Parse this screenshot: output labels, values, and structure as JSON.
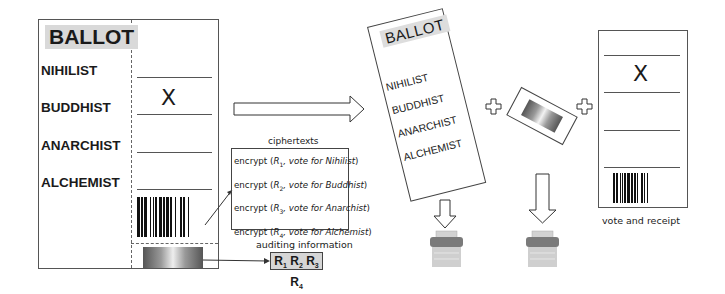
{
  "diagram": {
    "left_ballot": {
      "title": "BALLOT",
      "candidates": [
        "NIHILIST",
        "BUDDHIST",
        "ANARCHIST",
        "ALCHEMIST"
      ],
      "marked_candidate_index": 1,
      "mark": "X"
    },
    "ciphertexts": {
      "title": "ciphertexts",
      "rows": [
        {
          "prefix": "encrypt (",
          "r": "R",
          "r_sub": "1",
          "mid": ", vote for ",
          "candidate": "Nihilist",
          "suffix": ")"
        },
        {
          "prefix": "encrypt (",
          "r": "R",
          "r_sub": "2",
          "mid": ", vote for ",
          "candidate": "Buddhist",
          "suffix": ")"
        },
        {
          "prefix": "encrypt (",
          "r": "R",
          "r_sub": "3",
          "mid": ", vote for ",
          "candidate": "Anarchist",
          "suffix": ")"
        },
        {
          "prefix": "encrypt (",
          "r": "R",
          "r_sub": "4",
          "mid": ", vote for ",
          "candidate": "Alchemist",
          "suffix": ")"
        }
      ]
    },
    "auditing": {
      "title": "auditing information",
      "values": [
        {
          "r": "R",
          "sub": "1"
        },
        {
          "r": "R",
          "sub": "2"
        },
        {
          "r": "R",
          "sub": "3"
        },
        {
          "r": "R",
          "sub": "4"
        }
      ]
    },
    "detached_ballot": {
      "title": "BALLOT",
      "candidates": [
        "NIHILIST",
        "BUDDHIST",
        "ANARCHIST",
        "ALCHEMIST"
      ]
    },
    "receipt": {
      "mark": "X",
      "caption": "vote and receipt"
    },
    "icons": {
      "right_arrow": "arrow-right-icon",
      "plus": "plus-icon",
      "down_arrow": "arrow-down-icon",
      "shredder": "shredder-icon"
    },
    "colors": {
      "ink": "#1a1a1a",
      "title_bg": "#d9d9d9",
      "audit_bg": "#d6d6d6",
      "bin_top": "#777777",
      "bin_body": "#c8c8c8"
    }
  }
}
